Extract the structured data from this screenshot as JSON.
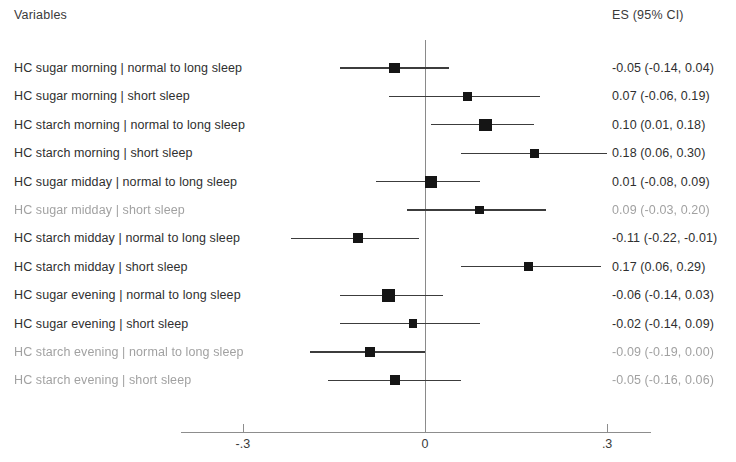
{
  "header": {
    "variables_label": "Variables",
    "es_label": "ES (95% CI)"
  },
  "axis": {
    "ticks": [
      {
        "label": "-.3",
        "value": -0.3
      },
      {
        "label": "0",
        "value": 0
      },
      {
        "label": ".3",
        "value": 0.3
      }
    ]
  },
  "chart_data": {
    "type": "forest",
    "title": "",
    "xlabel": "",
    "ylabel": "",
    "xlim": [
      -0.42,
      0.37
    ],
    "grid": false,
    "reference_line": 0,
    "columns": [
      "Variables",
      "ES (95% CI)"
    ],
    "rows": [
      {
        "label": "HC sugar morning | normal to long sleep",
        "stat": "-0.05 (-0.14, 0.04)",
        "es": -0.05,
        "lower": -0.14,
        "upper": 0.04,
        "weight": 0.62,
        "faded": false
      },
      {
        "label": "HC sugar morning | short sleep",
        "stat": "0.07 (-0.06, 0.19)",
        "es": 0.07,
        "lower": -0.06,
        "upper": 0.19,
        "weight": 0.38,
        "faded": false
      },
      {
        "label": "HC starch morning | normal to long sleep",
        "stat": "0.10 (0.01, 0.18)",
        "es": 0.1,
        "lower": 0.01,
        "upper": 0.18,
        "weight": 0.92,
        "faded": false
      },
      {
        "label": "HC starch morning | short sleep",
        "stat": "0.18 (0.06, 0.30)",
        "es": 0.18,
        "lower": 0.06,
        "upper": 0.3,
        "weight": 0.42,
        "faded": false
      },
      {
        "label": "HC sugar midday | normal to long sleep",
        "stat": "0.01 (-0.08, 0.09)",
        "es": 0.01,
        "lower": -0.08,
        "upper": 0.09,
        "weight": 0.88,
        "faded": false
      },
      {
        "label": "HC sugar midday | short sleep",
        "stat": "0.09 (-0.03, 0.20)",
        "es": 0.09,
        "lower": -0.03,
        "upper": 0.2,
        "weight": 0.4,
        "faded": true
      },
      {
        "label": "HC starch midday | normal to long sleep",
        "stat": "-0.11 (-0.22, -0.01)",
        "es": -0.11,
        "lower": -0.22,
        "upper": -0.01,
        "weight": 0.55,
        "faded": false
      },
      {
        "label": "HC starch midday | short sleep",
        "stat": "0.17 (0.06, 0.29)",
        "es": 0.17,
        "lower": 0.06,
        "upper": 0.29,
        "weight": 0.42,
        "faded": false
      },
      {
        "label": "HC sugar evening | normal to long sleep",
        "stat": "-0.06 (-0.14, 0.03)",
        "es": -0.06,
        "lower": -0.14,
        "upper": 0.03,
        "weight": 0.95,
        "faded": false
      },
      {
        "label": "HC sugar evening | short sleep",
        "stat": "-0.02 (-0.14, 0.09)",
        "es": -0.02,
        "lower": -0.14,
        "upper": 0.09,
        "weight": 0.38,
        "faded": false
      },
      {
        "label": "HC starch evening | normal to long sleep",
        "stat": "-0.09 (-0.19, 0.00)",
        "es": -0.09,
        "lower": -0.19,
        "upper": 0.0,
        "weight": 0.6,
        "faded": true
      },
      {
        "label": "HC starch evening | short sleep",
        "stat": "-0.05 (-0.16, 0.06)",
        "es": -0.05,
        "lower": -0.16,
        "upper": 0.06,
        "weight": 0.58,
        "faded": true
      }
    ]
  }
}
